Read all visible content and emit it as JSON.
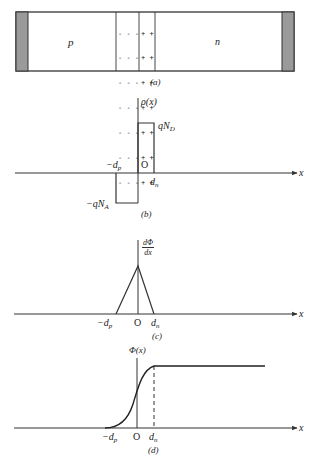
{
  "figure": {
    "panel_a": {
      "caption": "(a)",
      "p_label": "p",
      "n_label": "n",
      "neg_rows": [
        "- - -",
        "- - -",
        "- - -",
        "- - -",
        "- - -",
        "- - -",
        "- - -"
      ],
      "pos_rows": [
        "+ +",
        "+ +",
        "+ +",
        "+ +",
        "+ +",
        "+ +",
        "+ +"
      ],
      "contact_color": "#9a9a9a"
    },
    "panel_b": {
      "caption": "(b)",
      "y_label": "ρ(x)",
      "x_label": "x",
      "donor_label": "qN",
      "donor_sub": "D",
      "acceptor_label": "−qN",
      "acceptor_sub": "A",
      "neg_dp_label": "−d",
      "neg_dp_sub": "p",
      "origin_label": "O",
      "dn_label": "d",
      "dn_sub": "n"
    },
    "panel_c": {
      "caption": "(c)",
      "y_label_num": "dΦ",
      "y_label_den": "dx",
      "x_label": "x",
      "neg_dp_label": "−d",
      "neg_dp_sub": "p",
      "origin_label": "O",
      "dn_label": "d",
      "dn_sub": "n"
    },
    "panel_d": {
      "caption": "(d)",
      "y_label": "Φ(x)",
      "x_label": "x",
      "neg_dp_label": "−d",
      "neg_dp_sub": "p",
      "origin_label": "O",
      "dn_label": "d",
      "dn_sub": "n"
    }
  }
}
